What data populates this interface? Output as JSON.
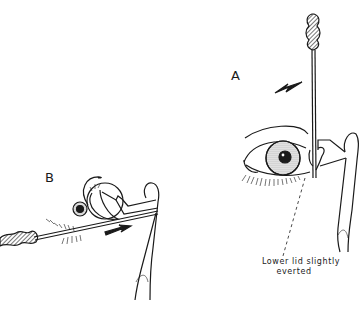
{
  "figure": {
    "panels": [
      {
        "id": "A",
        "label": "A",
        "description": "Cotton-tipped applicator inserted vertically into lower lacrimal punctum; arrow indicates direction"
      },
      {
        "id": "B",
        "label": "B",
        "description": "Side view: applicator inserted horizontally through punctum into canaliculus; arrow indicates direction"
      }
    ],
    "annotation": {
      "line1": "Lower lid slightly",
      "line2": "everted"
    },
    "colors": {
      "ink": "#1a1a1a",
      "background": "#ffffff"
    }
  }
}
